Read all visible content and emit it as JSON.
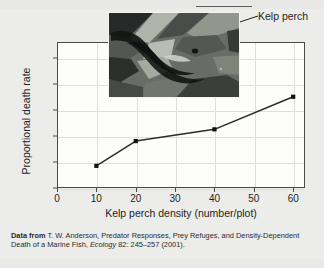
{
  "figure": {
    "callout_label": "Kelp perch",
    "photo_alt": "kelp-perch-photo"
  },
  "source_note": {
    "lead": "Data from",
    "text_before_journal": " T. W. Anderson, Predator Responses, Prey Refuges, and Density-Dependent Death of a Marine Fish, ",
    "journal": "Ecology",
    "text_after_journal": " 82: 245–257 (2001)."
  },
  "chart_data": {
    "type": "line",
    "title": "",
    "xlabel": "Kelp perch density (number/plot)",
    "ylabel": "Proportional death rate",
    "x": [
      10,
      20,
      40,
      60
    ],
    "values": [
      0.17,
      0.36,
      0.45,
      0.7
    ],
    "xlim": [
      0,
      63
    ],
    "ylim": [
      0,
      1.12
    ],
    "xticks": [
      0,
      10,
      20,
      30,
      40,
      50,
      60
    ],
    "xtick_labels": [
      "0",
      "10",
      "20",
      "30",
      "40",
      "50",
      "60"
    ],
    "yticks": [
      0,
      0.2,
      0.4,
      0.6,
      0.8,
      1.0
    ],
    "ytick_labels": [
      "0",
      "0.2",
      "0.4",
      "0.6",
      "0.8",
      "1.0"
    ],
    "grid": true,
    "legend": "none",
    "marker": "filled-square",
    "line_color": "#2b2b29",
    "marker_color": "#111111"
  }
}
